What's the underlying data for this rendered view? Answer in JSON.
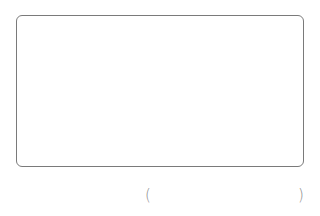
{
  "answer_box": {
    "value": "",
    "border_color": "#7a7a7a"
  },
  "blank": {
    "open_paren": "(",
    "close_paren": ")",
    "value": "",
    "paren_color": "#8a8a8a"
  }
}
